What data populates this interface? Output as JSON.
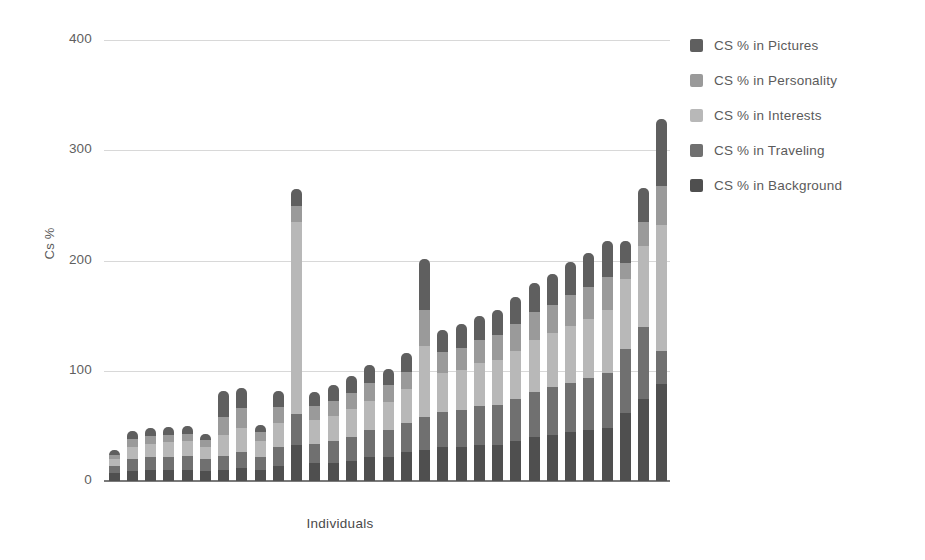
{
  "chart_data": {
    "type": "bar",
    "subtype": "stacked-bar",
    "title": "",
    "xlabel": "Individuals",
    "ylabel": "Cs %",
    "ylim": [
      0,
      400
    ],
    "yticks": [
      0,
      100,
      200,
      300,
      400
    ],
    "ytick_labels": [
      "0",
      "100",
      "200",
      "300",
      "400"
    ],
    "grid": true,
    "xtick_labels": [],
    "legend_position": "right",
    "bar_count": 31,
    "categories": [
      "1",
      "2",
      "3",
      "4",
      "5",
      "6",
      "7",
      "8",
      "9",
      "10",
      "11",
      "12",
      "13",
      "14",
      "15",
      "16",
      "17",
      "18",
      "19",
      "20",
      "21",
      "22",
      "23",
      "24",
      "25",
      "26",
      "27",
      "28",
      "29",
      "30",
      "31"
    ],
    "series": [
      {
        "name": "CS % in Background",
        "color": "#4f4f4f",
        "values": [
          7,
          9,
          10,
          10,
          10,
          9,
          10,
          12,
          10,
          14,
          33,
          16,
          16,
          18,
          22,
          22,
          26,
          28,
          31,
          31,
          33,
          33,
          36,
          40,
          42,
          44,
          46,
          48,
          62,
          74,
          88
        ]
      },
      {
        "name": "CS % in Traveling",
        "color": "#707070",
        "values": [
          7,
          11,
          12,
          12,
          13,
          11,
          13,
          14,
          12,
          17,
          28,
          18,
          20,
          22,
          24,
          24,
          27,
          30,
          32,
          33,
          35,
          36,
          38,
          41,
          43,
          45,
          47,
          50,
          58,
          66,
          30
        ]
      },
      {
        "name": "CS % in Interests",
        "color": "#b8b8b8",
        "values": [
          6,
          11,
          12,
          13,
          13,
          11,
          19,
          22,
          14,
          22,
          174,
          21,
          23,
          25,
          27,
          26,
          30,
          64,
          35,
          37,
          39,
          41,
          44,
          47,
          49,
          52,
          54,
          57,
          63,
          73,
          114
        ]
      },
      {
        "name": "CS % in Personality",
        "color": "#9a9a9a",
        "values": [
          4,
          7,
          7,
          7,
          7,
          6,
          16,
          18,
          8,
          14,
          14,
          13,
          14,
          15,
          16,
          15,
          16,
          33,
          19,
          20,
          21,
          22,
          24,
          25,
          26,
          28,
          29,
          30,
          15,
          22,
          36
        ]
      },
      {
        "name": "CS % in Pictures",
        "color": "#5f5f5f",
        "values": [
          4,
          7,
          7,
          7,
          7,
          6,
          24,
          18,
          7,
          15,
          16,
          13,
          14,
          15,
          16,
          15,
          17,
          46,
          20,
          21,
          22,
          23,
          25,
          27,
          28,
          30,
          31,
          33,
          20,
          31,
          60
        ]
      }
    ],
    "totals": [
      28,
      45,
      48,
      49,
      50,
      43,
      82,
      84,
      51,
      82,
      265,
      81,
      87,
      95,
      105,
      102,
      116,
      201,
      137,
      142,
      150,
      155,
      167,
      180,
      188,
      199,
      207,
      218,
      218,
      266,
      328
    ]
  },
  "legend": {
    "items": [
      {
        "label": "CS % in Pictures",
        "color": "#5f5f5f"
      },
      {
        "label": "CS % in Personality",
        "color": "#9a9a9a"
      },
      {
        "label": "CS % in Interests",
        "color": "#b8b8b8"
      },
      {
        "label": "CS % in Traveling",
        "color": "#707070"
      },
      {
        "label": "CS % in Background",
        "color": "#4f4f4f"
      }
    ]
  },
  "colors": {
    "background": "#ffffff",
    "gridline": "#d8d8d8",
    "axis": "#7a7a7a",
    "text": "#5b5b5b"
  }
}
